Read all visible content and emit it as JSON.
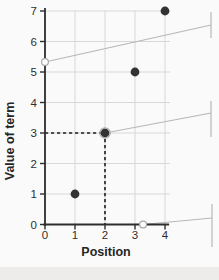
{
  "chart_data": {
    "type": "scatter",
    "title": "",
    "xlabel": "Position",
    "ylabel": "Value of term",
    "x": [
      1,
      2,
      3,
      4
    ],
    "y": [
      1,
      3,
      5,
      7
    ],
    "xticks": [
      "0",
      "1",
      "2",
      "3",
      "4"
    ],
    "yticks": [
      "0",
      "1",
      "2",
      "3",
      "4",
      "5",
      "6",
      "7"
    ],
    "xlim": [
      0,
      4
    ],
    "ylim": [
      0,
      7
    ],
    "grid": true,
    "legend": null,
    "highlight_point": {
      "x": 2,
      "y": 3,
      "dashed_guides": true
    },
    "annotations": [
      {
        "marker": "open-circle",
        "anchor_x": 0,
        "anchor_y": 5.33,
        "leader_end": [
          211,
          25
        ],
        "tab": [
          211,
          12,
          38
        ]
      },
      {
        "marker": "ring-on-point",
        "anchor_x": 2,
        "anchor_y": 3,
        "leader_end": [
          211,
          113
        ],
        "tab": [
          211,
          101,
          137
        ]
      },
      {
        "marker": "open-circle",
        "anchor_x": 3.27,
        "anchor_y": 0,
        "leader_end": [
          212,
          218
        ],
        "tab": [
          212,
          204,
          247
        ]
      }
    ]
  },
  "colors": {
    "point": "#333333",
    "grid": "#d8d8d8",
    "axis": "#2e2e2e",
    "dashed_guide": "#1c1c1c",
    "callout": "#b7b7b7",
    "open_circle_stroke": "#a8a8a8",
    "background": "#fbfafa"
  }
}
